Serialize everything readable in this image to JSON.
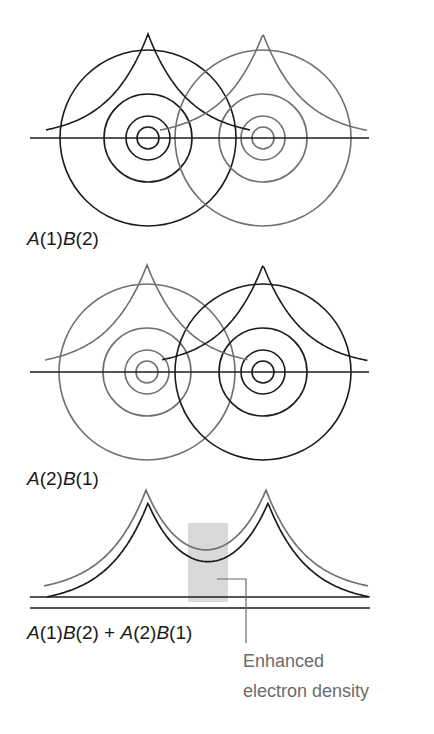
{
  "colors": {
    "dark": "#1c1c1c",
    "gray": "#707070",
    "shade": "#d9d9d9",
    "note": "#6b6b6b"
  },
  "panels": [
    {
      "id": "a1b2",
      "label": {
        "parts": [
          {
            "t": "A",
            "i": true
          },
          {
            "t": "(1)",
            "i": false
          },
          {
            "t": "B",
            "i": true
          },
          {
            "t": "(2)",
            "i": false
          }
        ],
        "text": "A(1)B(2)"
      },
      "baseline_y": 138,
      "axis": {
        "x1": 30,
        "x2": 369
      },
      "atoms": [
        {
          "name": "A",
          "cx": 148,
          "color": "dark",
          "radii": [
            11,
            22,
            44,
            88
          ]
        },
        {
          "name": "B",
          "cx": 263,
          "color": "gray",
          "radii": [
            11,
            22,
            44,
            88
          ]
        }
      ],
      "cusps": [
        {
          "atom": "A",
          "color": "dark",
          "peak_y": 34,
          "decay": 40,
          "extent_left": 102,
          "extent_right": 102
        },
        {
          "atom": "B",
          "color": "gray",
          "peak_y": 34,
          "decay": 40,
          "extent_left": 103,
          "extent_right": 105
        }
      ]
    },
    {
      "id": "a2b1",
      "label": {
        "parts": [
          {
            "t": "A",
            "i": true
          },
          {
            "t": "(2)",
            "i": false
          },
          {
            "t": "B",
            "i": true
          },
          {
            "t": "(1)",
            "i": false
          }
        ],
        "text": "A(2)B(1)"
      },
      "baseline_y": 372,
      "axis": {
        "x1": 30,
        "x2": 369
      },
      "atoms": [
        {
          "name": "A",
          "cx": 147,
          "color": "gray",
          "radii": [
            11,
            22,
            44,
            88
          ]
        },
        {
          "name": "B",
          "cx": 263,
          "color": "dark",
          "radii": [
            11,
            22,
            44,
            88
          ]
        }
      ],
      "cusps": [
        {
          "atom": "A",
          "color": "gray",
          "peak_y": 265,
          "decay": 40,
          "extent_left": 102,
          "extent_right": 101,
          "foot_offset": 4
        },
        {
          "atom": "B",
          "color": "dark",
          "peak_y": 265,
          "decay": 40,
          "extent_left": 101,
          "extent_right": 105,
          "foot_offset": 4
        }
      ]
    }
  ],
  "combined": {
    "label": {
      "parts": [
        {
          "t": "A",
          "i": true
        },
        {
          "t": "(1)",
          "i": false
        },
        {
          "t": "B",
          "i": true
        },
        {
          "t": "(2) + ",
          "i": false
        },
        {
          "t": "A",
          "i": true
        },
        {
          "t": "(2)",
          "i": false
        },
        {
          "t": "B",
          "i": true
        },
        {
          "t": "(1)",
          "i": false
        }
      ],
      "text": "A(1)B(2) + A(2)B(1)"
    },
    "curves": [
      {
        "color": "gray",
        "baseline_y": 597,
        "peaks": [
          146,
          266
        ],
        "peak_y": 490,
        "decay": 40,
        "x1": 44,
        "x2": 368,
        "axis": {
          "x1": 30,
          "x2": 368
        }
      },
      {
        "color": "dark",
        "baseline_y": 608,
        "peaks": [
          148,
          268
        ],
        "peak_y": 503,
        "decay": 40,
        "x1": 47,
        "x2": 370,
        "axis": {
          "x1": 30,
          "x2": 370
        }
      }
    ],
    "shade_rect": {
      "x": 188,
      "y": 523,
      "w": 40,
      "h": 79
    },
    "leader": {
      "x1": 217,
      "y1": 579,
      "x2": 246,
      "y2": 643
    }
  },
  "annotation": {
    "line1": "Enhanced",
    "line2": "electron density"
  }
}
